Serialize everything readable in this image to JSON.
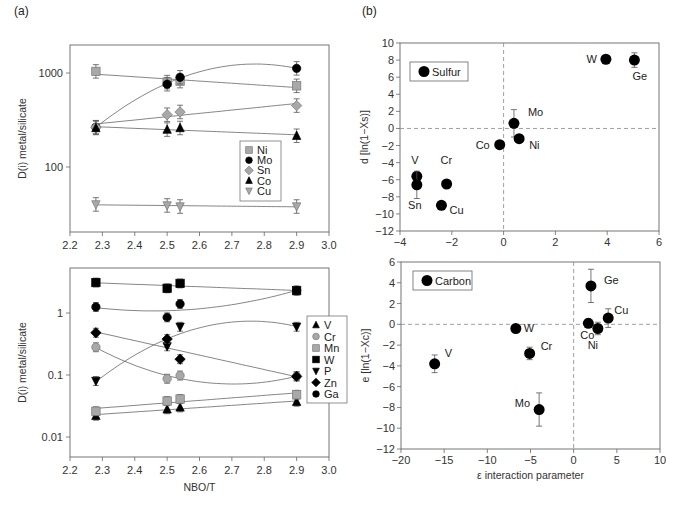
{
  "panels": {
    "a": "(a)",
    "b": "(b)"
  },
  "chart_data": [
    {
      "id": "a-top",
      "type": "scatter",
      "title": "",
      "xlabel": "",
      "ylabel": "D(i) metal/silicate",
      "yscale": "log",
      "xlim": [
        2.2,
        3.0
      ],
      "ylim": [
        20,
        2000
      ],
      "xticks": [
        "2.2",
        "2.3",
        "2.4",
        "2.5",
        "2.6",
        "2.7",
        "2.8",
        "2.9",
        "3.0"
      ],
      "yticks": [
        "100",
        "1000"
      ],
      "legend_position": "lower right inside",
      "x": [
        2.28,
        2.5,
        2.54,
        2.9
      ],
      "series": [
        {
          "name": "Ni",
          "marker": "square-gray",
          "values": [
            1040,
            800,
            820,
            730
          ]
        },
        {
          "name": "Mo",
          "marker": "circle-black",
          "values": [
            265,
            760,
            900,
            1120
          ]
        },
        {
          "name": "Sn",
          "marker": "diamond-gray",
          "values": [
            265,
            360,
            385,
            450
          ]
        },
        {
          "name": "Co",
          "marker": "triangle-up-black",
          "values": [
            260,
            250,
            260,
            215
          ]
        },
        {
          "name": "Cu",
          "marker": "triangle-down-gray",
          "values": [
            40,
            39,
            38,
            38
          ]
        }
      ]
    },
    {
      "id": "a-bottom",
      "type": "scatter",
      "title": "",
      "xlabel": "NBO/T",
      "ylabel": "D(i) metal/silicate",
      "yscale": "log",
      "xlim": [
        2.2,
        3.0
      ],
      "ylim": [
        0.004,
        5
      ],
      "xticks": [
        "2.2",
        "2.3",
        "2.4",
        "2.5",
        "2.6",
        "2.7",
        "2.8",
        "2.9",
        "3.0"
      ],
      "yticks": [
        "0.01",
        "0.1",
        "1"
      ],
      "legend_position": "right outside",
      "x": [
        2.28,
        2.5,
        2.54,
        2.9
      ],
      "series": [
        {
          "name": "V",
          "marker": "triangle-up-black",
          "values": [
            0.022,
            0.028,
            0.03,
            0.037
          ]
        },
        {
          "name": "Cr",
          "marker": "circle-gray",
          "values": [
            0.28,
            0.087,
            0.098,
            0.095
          ]
        },
        {
          "name": "Mn",
          "marker": "square-gray",
          "values": [
            0.026,
            0.038,
            0.041,
            0.048
          ]
        },
        {
          "name": "W",
          "marker": "square-black",
          "values": [
            3.1,
            2.5,
            3.0,
            2.3
          ]
        },
        {
          "name": "P",
          "marker": "triangle-down-black",
          "values": [
            0.08,
            0.29,
            0.6,
            0.6
          ]
        },
        {
          "name": "Zn",
          "marker": "diamond-black",
          "values": [
            0.48,
            0.38,
            0.18,
            0.095
          ]
        },
        {
          "name": "Ga",
          "marker": "circle-black",
          "values": [
            1.25,
            0.85,
            1.4,
            2.3
          ]
        }
      ]
    },
    {
      "id": "b-top",
      "type": "scatter",
      "title": "",
      "xlabel": "",
      "ylabel": "d [ln(1−Xs)]",
      "xlim": [
        -4,
        6
      ],
      "ylim": [
        -12,
        10
      ],
      "xticks": [
        "−4",
        "−2",
        "0",
        "2",
        "4",
        "6"
      ],
      "yticks": [
        "−12",
        "−10",
        "−8",
        "−6",
        "−4",
        "−2",
        "0",
        "2",
        "4",
        "6",
        "8",
        "10"
      ],
      "legend": "Sulfur",
      "points": [
        {
          "label": "W",
          "x": 3.95,
          "y": 8.1
        },
        {
          "label": "Ge",
          "x": 5.05,
          "y": 8.0
        },
        {
          "label": "Mo",
          "x": 0.4,
          "y": 0.6
        },
        {
          "label": "Ni",
          "x": 0.6,
          "y": -1.2
        },
        {
          "label": "Co",
          "x": -0.15,
          "y": -1.9
        },
        {
          "label": "V",
          "x": -3.35,
          "y": -5.6
        },
        {
          "label": "Sn",
          "x": -3.35,
          "y": -6.6
        },
        {
          "label": "Cr",
          "x": -2.2,
          "y": -6.5
        },
        {
          "label": "Cu",
          "x": -2.4,
          "y": -9.0
        }
      ]
    },
    {
      "id": "b-bottom",
      "type": "scatter",
      "title": "",
      "xlabel": "ε interaction parameter",
      "ylabel": "e [ln(1−Xc)]",
      "xlim": [
        -20,
        10
      ],
      "ylim": [
        -12,
        6
      ],
      "xticks": [
        "−20",
        "−15",
        "−10",
        "−5",
        "0",
        "5",
        "10"
      ],
      "yticks": [
        "−12",
        "−10",
        "−8",
        "−6",
        "−4",
        "−2",
        "0",
        "2",
        "4",
        "6"
      ],
      "legend": "Carbon",
      "points": [
        {
          "label": "Ge",
          "x": 2.0,
          "y": 3.7
        },
        {
          "label": "Cu",
          "x": 4.0,
          "y": 0.6
        },
        {
          "label": "Co",
          "x": 1.7,
          "y": 0.1
        },
        {
          "label": "Ni",
          "x": 2.8,
          "y": -0.4
        },
        {
          "label": "W",
          "x": -6.7,
          "y": -0.4
        },
        {
          "label": "Cr",
          "x": -5.1,
          "y": -2.8
        },
        {
          "label": "V",
          "x": -16.1,
          "y": -3.8
        },
        {
          "label": "Mo",
          "x": -4.0,
          "y": -8.2
        }
      ]
    }
  ]
}
